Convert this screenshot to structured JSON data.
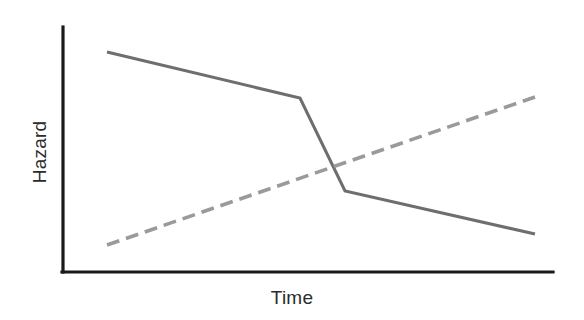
{
  "figure": {
    "background_color": "#ffffff",
    "width": 584,
    "height": 320
  },
  "axes": {
    "x_title": "Time",
    "y_title": "Hazard",
    "axis_color": "#1a1a1a",
    "origin": {
      "x": 63,
      "y": 272
    },
    "x_end": {
      "x": 553,
      "y": 272
    },
    "y_top": {
      "x": 63,
      "y": 27
    }
  },
  "chart_data": {
    "type": "line",
    "title": "",
    "subtitle": "",
    "xlabel": "Time",
    "ylabel": "Hazard",
    "xlim": [
      0,
      100
    ],
    "ylim": [
      0,
      100
    ],
    "grid": false,
    "legend": null,
    "axis_ticks": {
      "x": [],
      "y": []
    },
    "annotations": [],
    "series": [
      {
        "name": "Declining hazard",
        "style": "solid",
        "color": "#6e6e6e",
        "linewidth": 3.1,
        "x": [
          9.0,
          48.4,
          57.6,
          96.3
        ],
        "y": [
          89.8,
          71.0,
          33.1,
          15.5
        ],
        "pixel_points": [
          [
            107,
            52
          ],
          [
            300,
            98
          ],
          [
            345,
            191
          ],
          [
            535,
            234
          ]
        ],
        "description": "Gradual decline, then a steep drop, then a gentle decline"
      },
      {
        "name": "Rising hazard",
        "style": "dashed",
        "color": "#9a9a9a",
        "linewidth": 3.6,
        "dash_pattern": [
          13,
          7
        ],
        "x": [
          9.0,
          96.3
        ],
        "y": [
          11.0,
          71.4
        ],
        "pixel_points": [
          [
            107,
            245
          ],
          [
            535,
            97
          ]
        ],
        "description": "Steadily increasing straight dashed line"
      }
    ],
    "crossover": {
      "label": "",
      "pixel_point": [
        327,
        165
      ]
    }
  }
}
